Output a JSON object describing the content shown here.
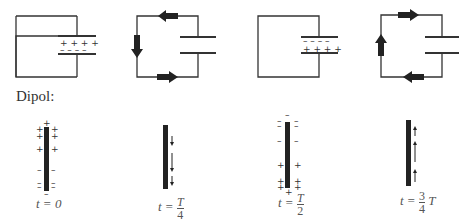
{
  "figure": {
    "circuits": [
      {
        "id": "c1",
        "state": "capacitor charged, + top plate, - bottom plate",
        "top_plate_charge": "+ + + +",
        "bottom_plate_charge": "- - - -",
        "current_arrows": []
      },
      {
        "id": "c2",
        "state": "current flowing",
        "current_arrows": [
          "top: left",
          "left: down",
          "bottom: right"
        ]
      },
      {
        "id": "c3",
        "state": "capacitor charged, - top plate, + bottom plate",
        "top_plate_charge": "- - - -",
        "bottom_plate_charge": "+ + + +",
        "current_arrows": []
      },
      {
        "id": "c4",
        "state": "current flowing",
        "current_arrows": [
          "top: right",
          "left: up",
          "bottom: left"
        ]
      }
    ],
    "dipole_label": "Dipol:",
    "dipoles": [
      {
        "id": "d1",
        "caption_t": "t = 0",
        "top": "+",
        "bottom": "-"
      },
      {
        "id": "d2",
        "caption_t": "t = T/4",
        "current": "down"
      },
      {
        "id": "d3",
        "caption_t": "t = T/2",
        "top": "-",
        "bottom": "+"
      },
      {
        "id": "d4",
        "caption_t": "t = 3/4 T",
        "current": "up"
      }
    ],
    "captions": {
      "d1": "t = 0",
      "d2_left": "t =",
      "d2_num": "T",
      "d2_den": "4",
      "d3_left": "t =",
      "d3_num": "T",
      "d3_den": "2",
      "d4_left": "t =",
      "d4_num": "3",
      "d4_den": "4",
      "d4_right": "T"
    }
  }
}
